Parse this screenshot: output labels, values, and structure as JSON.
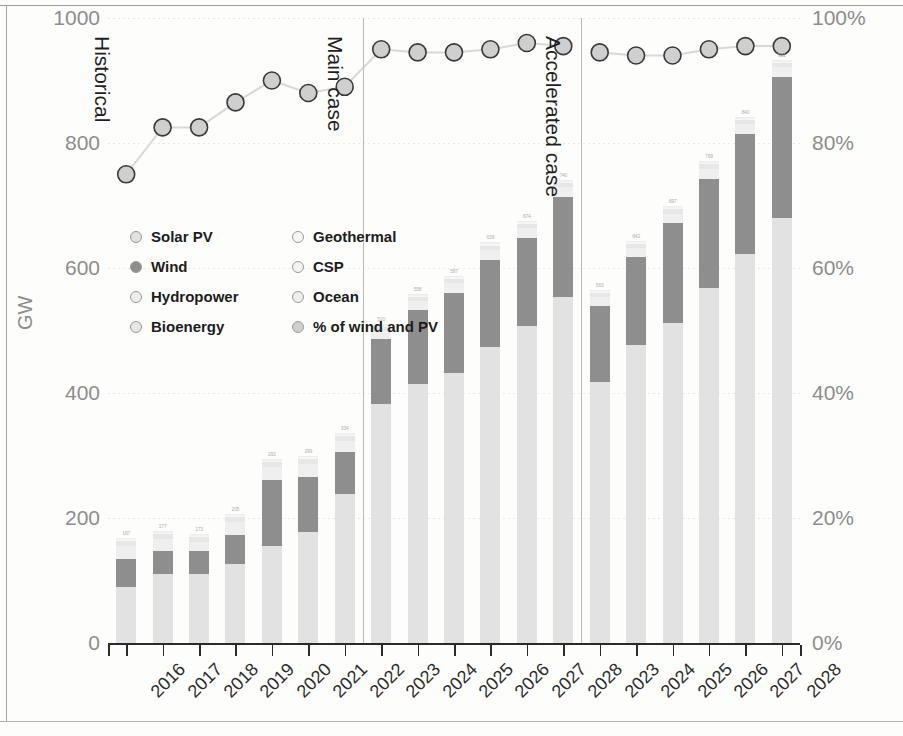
{
  "axes": {
    "y_left_title": "GW",
    "y_left_ticks": [
      "0",
      "200",
      "400",
      "600",
      "800",
      "1000"
    ],
    "y_right_ticks": [
      "0%",
      "20%",
      "40%",
      "60%",
      "80%",
      "100%"
    ]
  },
  "scenarios": [
    {
      "label": "Historical"
    },
    {
      "label": "Main case"
    },
    {
      "label": "Accelerated case"
    }
  ],
  "legend": {
    "items": [
      {
        "label": "Solar PV",
        "color": "#e2e2e2",
        "icon": "circle-marker-icon"
      },
      {
        "label": "Geothermal",
        "color": "#f6f6f6",
        "icon": "circle-marker-icon"
      },
      {
        "label": "Wind",
        "color": "#8e8e8e",
        "icon": "circle-marker-icon"
      },
      {
        "label": "CSP",
        "color": "#f2f2f2",
        "icon": "circle-marker-icon"
      },
      {
        "label": "Hydropower",
        "color": "#efefef",
        "icon": "circle-marker-icon"
      },
      {
        "label": "Ocean",
        "color": "#ededed",
        "icon": "circle-marker-icon"
      },
      {
        "label": "Bioenergy",
        "color": "#e7e7e7",
        "icon": "circle-marker-icon"
      },
      {
        "label": "% of wind and PV",
        "color": "#cfcfcf",
        "icon": "circle-marker-icon"
      }
    ]
  },
  "chart_data": {
    "type": "bar",
    "title": "",
    "subtitle": "",
    "xlabel": "",
    "ylabel": "GW",
    "y2label": "",
    "ylim": [
      0,
      1000
    ],
    "y2lim": [
      0,
      100
    ],
    "grid": false,
    "legend_position": "inside-upper-left",
    "stacked": true,
    "categories": [
      "2016",
      "2017",
      "2018",
      "2019",
      "2020",
      "2021",
      "2022",
      "2023",
      "2024",
      "2025",
      "2026",
      "2027",
      "2028",
      "2023",
      "2024",
      "2025",
      "2026",
      "2027",
      "2028"
    ],
    "groups": [
      {
        "name": "Historical",
        "categories": [
          "2016",
          "2017",
          "2018",
          "2019",
          "2020",
          "2021",
          "2022"
        ]
      },
      {
        "name": "Main case",
        "categories": [
          "2023",
          "2024",
          "2025",
          "2026",
          "2027",
          "2028"
        ]
      },
      {
        "name": "Accelerated case",
        "categories": [
          "2023",
          "2024",
          "2025",
          "2026",
          "2027",
          "2028"
        ]
      }
    ],
    "series": [
      {
        "name": "Solar PV",
        "color": "#e2e2e2",
        "values": [
          90,
          110,
          110,
          126,
          156,
          178,
          238,
          382,
          415,
          432,
          473,
          508,
          553,
          418,
          477,
          512,
          568,
          622,
          680
        ]
      },
      {
        "name": "Wind",
        "color": "#8e8e8e",
        "values": [
          45,
          38,
          38,
          47,
          105,
          88,
          67,
          105,
          118,
          128,
          140,
          140,
          160,
          122,
          140,
          160,
          175,
          192,
          225
        ]
      },
      {
        "name": "Hydropower",
        "color": "#efefef",
        "values": [
          20,
          18,
          14,
          21,
          20,
          21,
          18,
          12,
          14,
          16,
          16,
          16,
          16,
          13,
          15,
          15,
          16,
          16,
          16
        ]
      },
      {
        "name": "Bioenergy",
        "color": "#e7e7e7",
        "values": [
          8,
          8,
          7,
          8,
          8,
          8,
          8,
          7,
          7,
          7,
          7,
          7,
          7,
          7,
          7,
          7,
          7,
          7,
          7
        ]
      },
      {
        "name": "Geothermal",
        "color": "#f6f6f6",
        "values": [
          2,
          2,
          2,
          2,
          2,
          2,
          2,
          2,
          2,
          2,
          2,
          2,
          2,
          2,
          2,
          2,
          2,
          2,
          2
        ]
      },
      {
        "name": "CSP",
        "color": "#f2f2f2",
        "values": [
          2,
          2,
          2,
          2,
          2,
          2,
          2,
          2,
          2,
          2,
          2,
          2,
          2,
          2,
          2,
          2,
          2,
          2,
          2
        ]
      },
      {
        "name": "Ocean",
        "color": "#ededed",
        "values": [
          1,
          1,
          1,
          1,
          1,
          1,
          1,
          1,
          1,
          1,
          1,
          1,
          1,
          1,
          1,
          1,
          1,
          1,
          1
        ]
      }
    ],
    "line_series": {
      "name": "% of wind and PV",
      "axis": "right",
      "color": "#cfcfcf",
      "marker": "circle",
      "values": [
        75,
        82.5,
        82.5,
        86.5,
        90,
        88,
        89,
        95,
        94.5,
        94.5,
        95,
        96,
        95.5,
        94.5,
        94,
        94,
        95,
        95.5,
        95.5
      ]
    },
    "bar_top_labels": [
      "167",
      "177",
      "173",
      "205",
      "292",
      "299",
      "334",
      "510",
      "558",
      "587",
      "639",
      "674",
      "740",
      "563",
      "642",
      "697",
      "769",
      "840",
      "931"
    ]
  }
}
